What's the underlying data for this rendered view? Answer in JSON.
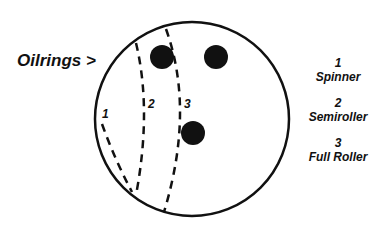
{
  "diagram": {
    "pointer_label": "Oilrings >",
    "line_labels": [
      "1",
      "2",
      "3"
    ],
    "legend": [
      {
        "number": "1",
        "name": "Spinner"
      },
      {
        "number": "2",
        "name": "Semiroller"
      },
      {
        "number": "3",
        "name": "Full Roller"
      }
    ],
    "colors": {
      "ink": "#111111",
      "background": "#ffffff"
    }
  }
}
